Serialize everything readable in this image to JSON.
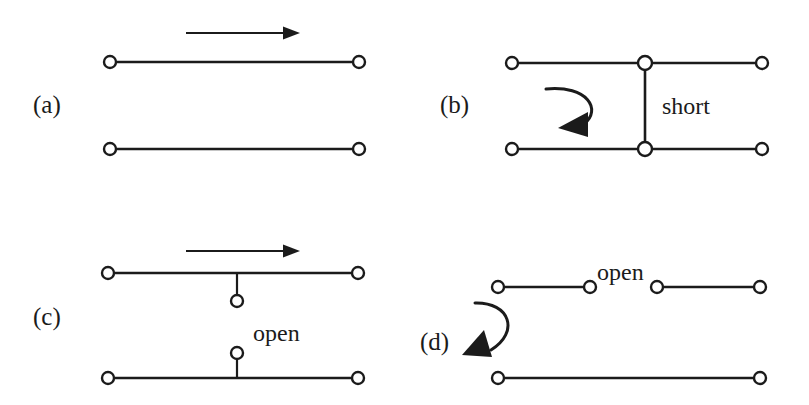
{
  "figure": {
    "background_color": "#ffffff",
    "ink_color": "#1b1b1b",
    "width": 809,
    "height": 405
  },
  "panels": [
    {
      "id": "a",
      "label": "(a)",
      "label_x": 33,
      "label_y": 113,
      "description": "matched two-conductor line with incident wave arrow",
      "annotation": "",
      "arrow_kind": "straight-right",
      "terminal_count": 4
    },
    {
      "id": "b",
      "label": "(b)",
      "label_x": 440,
      "label_y": 113,
      "description": "line terminated in a short circuit with reflected wave arrow",
      "annotation": "short",
      "annotation_x": 662,
      "annotation_y": 114,
      "arrow_kind": "curved-left",
      "terminal_count": 6
    },
    {
      "id": "c",
      "label": "(c)",
      "label_x": 33,
      "label_y": 325,
      "description": "line with open-circuited stubs and incident wave arrow",
      "annotation": "open",
      "annotation_x": 253,
      "annotation_y": 341,
      "arrow_kind": "straight-right",
      "terminal_count": 6
    },
    {
      "id": "d",
      "label": "(d)",
      "label_x": 420,
      "label_y": 350,
      "description": "line broken by an open gap with reflected wave arrow",
      "annotation": "open",
      "annotation_x": 597,
      "annotation_y": 280,
      "arrow_kind": "curved-down-left",
      "terminal_count": 6
    }
  ],
  "geometry": {
    "panel_a": {
      "top_line": {
        "x1": 110,
        "x2": 359,
        "y": 62
      },
      "bottom_line": {
        "x1": 110,
        "x2": 359,
        "y": 149
      },
      "terminals": [
        {
          "cx": 110,
          "cy": 62,
          "r": 6
        },
        {
          "cx": 359,
          "cy": 62,
          "r": 6
        },
        {
          "cx": 110,
          "cy": 149,
          "r": 6
        },
        {
          "cx": 359,
          "cy": 149,
          "r": 6
        }
      ],
      "arrow": {
        "x1": 186,
        "x2": 288,
        "y": 33
      }
    },
    "panel_b": {
      "top_line": {
        "x1": 512,
        "x2": 762,
        "y": 63
      },
      "bottom_line": {
        "x1": 512,
        "x2": 762,
        "y": 149
      },
      "short_bar": {
        "x": 645,
        "y1": 63,
        "y2": 149
      },
      "terminals": [
        {
          "cx": 512,
          "cy": 63,
          "r": 6
        },
        {
          "cx": 645,
          "cy": 63,
          "r": 7
        },
        {
          "cx": 762,
          "cy": 63,
          "r": 6
        },
        {
          "cx": 512,
          "cy": 149,
          "r": 6
        },
        {
          "cx": 645,
          "cy": 149,
          "r": 7
        },
        {
          "cx": 762,
          "cy": 149,
          "r": 6
        }
      ],
      "curve": "M 546 90 C 586 86 600 108 586 122"
    },
    "panel_c": {
      "top_line": {
        "x1": 108,
        "x2": 358,
        "y": 273
      },
      "bottom_line": {
        "x1": 108,
        "x2": 358,
        "y": 378
      },
      "upper_stub": {
        "x": 237,
        "y1": 273,
        "y2": 294
      },
      "lower_stub": {
        "x": 237,
        "y1": 360,
        "y2": 378
      },
      "terminals": [
        {
          "cx": 108,
          "cy": 273,
          "r": 6
        },
        {
          "cx": 358,
          "cy": 273,
          "r": 6
        },
        {
          "cx": 237,
          "cy": 300,
          "r": 6
        },
        {
          "cx": 237,
          "cy": 353,
          "r": 6
        },
        {
          "cx": 108,
          "cy": 378,
          "r": 6
        },
        {
          "cx": 358,
          "cy": 378,
          "r": 6
        }
      ],
      "arrow": {
        "x1": 186,
        "x2": 288,
        "y": 251
      }
    },
    "panel_d": {
      "top_left_segment": {
        "x1": 498,
        "x2": 590,
        "y": 287
      },
      "top_right_segment": {
        "x1": 657,
        "x2": 760,
        "y": 287
      },
      "bottom_line": {
        "x1": 498,
        "x2": 760,
        "y": 378
      },
      "terminals": [
        {
          "cx": 498,
          "cy": 287,
          "r": 6
        },
        {
          "cx": 590,
          "cy": 287,
          "r": 6
        },
        {
          "cx": 657,
          "cy": 287,
          "r": 6
        },
        {
          "cx": 760,
          "cy": 287,
          "r": 6
        },
        {
          "cx": 498,
          "cy": 378,
          "r": 6
        },
        {
          "cx": 760,
          "cy": 378,
          "r": 6
        }
      ],
      "curve": "M 473 303 C 507 303 516 330 489 349"
    }
  }
}
